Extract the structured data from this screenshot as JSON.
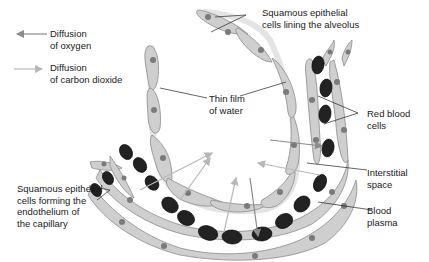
{
  "legend": {
    "items": [
      {
        "label": "Diffusion\nof oxygen",
        "arrow_color": "#8c8c8c",
        "direction": "left"
      },
      {
        "label": "Diffusion\nof carbon dioxide",
        "arrow_color": "#b8b8b8",
        "direction": "right"
      }
    ]
  },
  "labels": {
    "alveolus_cells": "Squamous epithelial\ncells lining the alveolus",
    "water_film": "Thin film\nof water",
    "red_blood_cells": "Red blood\ncells",
    "interstitial_space": "Interstitial\nspace",
    "blood_plasma": "Blood\nplasma",
    "endothelium_cells": "Squamous epithelial\ncells forming the\nendothelium of\nthe capillary"
  },
  "colors": {
    "cell_fill": "#cfcfcf",
    "cell_stroke": "#8a8a8a",
    "nucleus": "#7a7a7a",
    "red_blood_cell": "#222222",
    "oxygen_arrow": "#8c8c8c",
    "carbon_dioxide_arrow": "#b8b8b8"
  }
}
